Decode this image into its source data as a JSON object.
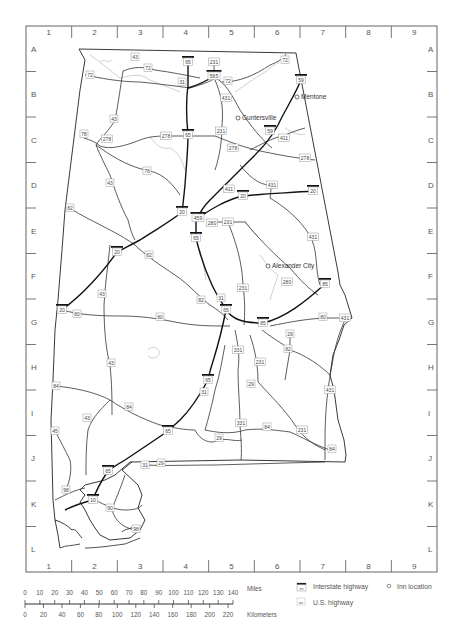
{
  "grid": {
    "columns": [
      "1",
      "2",
      "3",
      "4",
      "5",
      "6",
      "7",
      "8",
      "9"
    ],
    "rows": [
      "A",
      "B",
      "C",
      "D",
      "E",
      "F",
      "G",
      "H",
      "I",
      "J",
      "K",
      "L"
    ]
  },
  "towns": [
    {
      "name": "Mentone",
      "x": 297,
      "y": 97
    },
    {
      "name": "Guntersville",
      "x": 238,
      "y": 118
    },
    {
      "name": "Alexander City",
      "x": 268,
      "y": 266
    }
  ],
  "interstate_shields": [
    {
      "num": "65",
      "x": 188,
      "y": 62
    },
    {
      "num": "565",
      "x": 214,
      "y": 76
    },
    {
      "num": "59",
      "x": 301,
      "y": 80
    },
    {
      "num": "65",
      "x": 188,
      "y": 135
    },
    {
      "num": "59",
      "x": 270,
      "y": 131
    },
    {
      "num": "20",
      "x": 182,
      "y": 212
    },
    {
      "num": "459",
      "x": 198,
      "y": 218
    },
    {
      "num": "65",
      "x": 196,
      "y": 238
    },
    {
      "num": "20",
      "x": 243,
      "y": 196
    },
    {
      "num": "20",
      "x": 313,
      "y": 191
    },
    {
      "num": "20",
      "x": 117,
      "y": 252
    },
    {
      "num": "85",
      "x": 325,
      "y": 284
    },
    {
      "num": "65",
      "x": 226,
      "y": 310
    },
    {
      "num": "85",
      "x": 263,
      "y": 323
    },
    {
      "num": "20",
      "x": 62,
      "y": 310
    },
    {
      "num": "65",
      "x": 208,
      "y": 380
    },
    {
      "num": "65",
      "x": 168,
      "y": 431
    },
    {
      "num": "65",
      "x": 108,
      "y": 471
    },
    {
      "num": "10",
      "x": 93,
      "y": 500
    }
  ],
  "us_shields": [
    {
      "num": "43",
      "x": 135,
      "y": 57
    },
    {
      "num": "72",
      "x": 148,
      "y": 68
    },
    {
      "num": "72",
      "x": 90,
      "y": 75
    },
    {
      "num": "231",
      "x": 214,
      "y": 62
    },
    {
      "num": "72",
      "x": 228,
      "y": 81
    },
    {
      "num": "72",
      "x": 285,
      "y": 60
    },
    {
      "num": "31",
      "x": 182,
      "y": 82
    },
    {
      "num": "431",
      "x": 226,
      "y": 98
    },
    {
      "num": "43",
      "x": 114,
      "y": 119
    },
    {
      "num": "78",
      "x": 84,
      "y": 134
    },
    {
      "num": "278",
      "x": 107,
      "y": 139
    },
    {
      "num": "278",
      "x": 166,
      "y": 136
    },
    {
      "num": "231",
      "x": 221,
      "y": 131
    },
    {
      "num": "278",
      "x": 233,
      "y": 148
    },
    {
      "num": "411",
      "x": 284,
      "y": 138
    },
    {
      "num": "278",
      "x": 305,
      "y": 158
    },
    {
      "num": "78",
      "x": 147,
      "y": 171
    },
    {
      "num": "43",
      "x": 110,
      "y": 183
    },
    {
      "num": "411",
      "x": 229,
      "y": 189
    },
    {
      "num": "431",
      "x": 272,
      "y": 185
    },
    {
      "num": "82",
      "x": 70,
      "y": 208
    },
    {
      "num": "280",
      "x": 212,
      "y": 223
    },
    {
      "num": "231",
      "x": 228,
      "y": 222
    },
    {
      "num": "431",
      "x": 313,
      "y": 237
    },
    {
      "num": "82",
      "x": 149,
      "y": 255
    },
    {
      "num": "280",
      "x": 287,
      "y": 282
    },
    {
      "num": "231",
      "x": 243,
      "y": 288
    },
    {
      "num": "43",
      "x": 102,
      "y": 294
    },
    {
      "num": "82",
      "x": 201,
      "y": 300
    },
    {
      "num": "31",
      "x": 221,
      "y": 298
    },
    {
      "num": "80",
      "x": 77,
      "y": 314
    },
    {
      "num": "80",
      "x": 160,
      "y": 317
    },
    {
      "num": "80",
      "x": 323,
      "y": 317
    },
    {
      "num": "431",
      "x": 345,
      "y": 318
    },
    {
      "num": "331",
      "x": 238,
      "y": 350
    },
    {
      "num": "29",
      "x": 290,
      "y": 334
    },
    {
      "num": "82",
      "x": 288,
      "y": 349
    },
    {
      "num": "231",
      "x": 260,
      "y": 362
    },
    {
      "num": "84",
      "x": 56,
      "y": 386
    },
    {
      "num": "43",
      "x": 111,
      "y": 363
    },
    {
      "num": "31",
      "x": 204,
      "y": 392
    },
    {
      "num": "29",
      "x": 251,
      "y": 384
    },
    {
      "num": "431",
      "x": 330,
      "y": 390
    },
    {
      "num": "84",
      "x": 129,
      "y": 407
    },
    {
      "num": "43",
      "x": 87,
      "y": 418
    },
    {
      "num": "331",
      "x": 241,
      "y": 423
    },
    {
      "num": "45",
      "x": 55,
      "y": 431
    },
    {
      "num": "29",
      "x": 219,
      "y": 438
    },
    {
      "num": "84",
      "x": 267,
      "y": 427
    },
    {
      "num": "231",
      "x": 302,
      "y": 430
    },
    {
      "num": "84",
      "x": 332,
      "y": 449
    },
    {
      "num": "31",
      "x": 145,
      "y": 465
    },
    {
      "num": "29",
      "x": 161,
      "y": 463
    },
    {
      "num": "98",
      "x": 66,
      "y": 490
    },
    {
      "num": "90",
      "x": 110,
      "y": 508
    },
    {
      "num": "98",
      "x": 136,
      "y": 529
    }
  ],
  "scale": {
    "miles_ticks": [
      "0",
      "10",
      "20",
      "30",
      "40",
      "50",
      "60",
      "70",
      "80",
      "90",
      "100",
      "110",
      "120",
      "130",
      "140"
    ],
    "miles_label": "Miles",
    "km_ticks": [
      "0",
      "20",
      "40",
      "60",
      "80",
      "100",
      "120",
      "140",
      "160",
      "180",
      "200",
      "220"
    ],
    "km_label": "Kilometers"
  },
  "legend": {
    "interstate": "Interstate highway",
    "us_highway": "U.S. highway",
    "inn": "Inn location",
    "shield_placeholder": "nn"
  }
}
